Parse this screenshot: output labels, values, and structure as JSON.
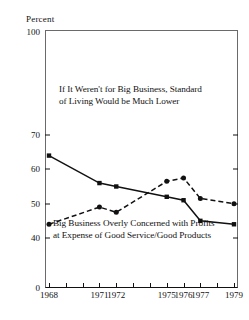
{
  "chart_data": {
    "type": "line",
    "title": "",
    "subtitle": "",
    "xlabel": "",
    "ylabel": "Percent",
    "grid": false,
    "legend_position": "inline-annotations",
    "x": [
      1968,
      1971,
      1972,
      1975,
      1976,
      1977,
      1979
    ],
    "xlim": [
      1968,
      1979
    ],
    "ylim": [
      40,
      100
    ],
    "y_axis_break": true,
    "y_zero_label": "0",
    "yticks": [
      40,
      50,
      60,
      70,
      100
    ],
    "ytick_labels": [
      "40",
      "50",
      "60",
      "70",
      "100"
    ],
    "xticks": [
      1968,
      1969,
      1970,
      1971,
      1972,
      1973,
      1974,
      1975,
      1976,
      1977,
      1978,
      1979
    ],
    "xtick_labels": [
      "1968",
      "1971",
      "1972",
      "1975",
      "1976",
      "1977",
      "1979"
    ],
    "xtick_labeled_years": [
      1968,
      1971,
      1972,
      1975,
      1976,
      1977,
      1979
    ],
    "series": [
      {
        "name": "If It Weren't for Big Business, Standard of Living Would be Much Lower",
        "style": "solid",
        "color": "#111111",
        "marker": "square",
        "values": [
          64,
          56,
          55,
          52,
          51,
          45,
          44
        ]
      },
      {
        "name": "Big Business Overly Concerned with Profits at Expense of Good Service/Good Products",
        "style": "dashed",
        "color": "#111111",
        "marker": "circle",
        "values": [
          44,
          49,
          47.5,
          56.5,
          57.5,
          51.5,
          50
        ]
      }
    ],
    "annotations": [
      {
        "id": "top",
        "line1": "If It Weren't for Big Business, Standard",
        "line2": "of Living Would be Much Lower"
      },
      {
        "id": "bottom",
        "line1": "Big Business Overly Concerned with Profits",
        "line2": "at Expense of Good Service/Good Products"
      }
    ]
  }
}
